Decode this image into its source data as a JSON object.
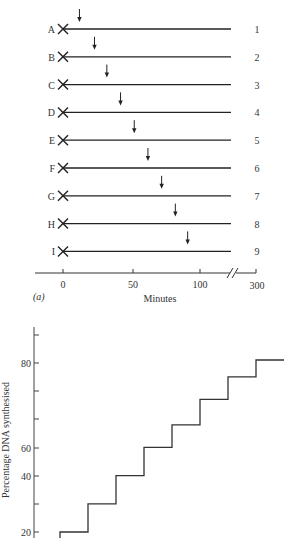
{
  "chart_data": [
    {
      "type": "diagram-timeline",
      "panel_label": "(a)",
      "xlabel": "Minutes",
      "x_ticks": [
        "0",
        "50",
        "100",
        "300"
      ],
      "axis_break": "//",
      "rows": [
        {
          "label": "A",
          "number": "1",
          "arrow_minute": 12
        },
        {
          "label": "B",
          "number": "2",
          "arrow_minute": 23
        },
        {
          "label": "C",
          "number": "3",
          "arrow_minute": 32
        },
        {
          "label": "D",
          "number": "4",
          "arrow_minute": 42
        },
        {
          "label": "E",
          "number": "5",
          "arrow_minute": 52
        },
        {
          "label": "F",
          "number": "6",
          "arrow_minute": 62
        },
        {
          "label": "G",
          "number": "7",
          "arrow_minute": 72
        },
        {
          "label": "H",
          "number": "8",
          "arrow_minute": 82
        },
        {
          "label": "I",
          "number": "9",
          "arrow_minute": 91
        }
      ]
    },
    {
      "type": "line",
      "subtype": "step",
      "ylabel": "Percentage DNA synthesised",
      "y_ticks": [
        "20",
        "40",
        "60",
        "80"
      ],
      "ylim": [
        20,
        90
      ],
      "steps": [
        20,
        30,
        40,
        50,
        58,
        67,
        75,
        81
      ]
    }
  ]
}
